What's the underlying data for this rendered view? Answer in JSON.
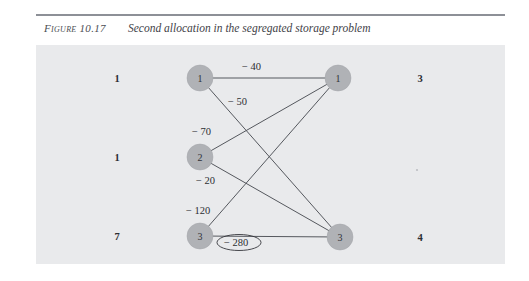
{
  "figure": {
    "label": "Figure 10.17",
    "caption": "Second allocation in the segregated storage problem"
  },
  "diagram": {
    "type": "bipartite-network",
    "left_nodes": [
      {
        "id": "L1",
        "label": "1",
        "supply": "1",
        "cx": 200,
        "cy": 78
      },
      {
        "id": "L2",
        "label": "2",
        "supply": "1",
        "cx": 200,
        "cy": 157
      },
      {
        "id": "L3",
        "label": "3",
        "supply": "7",
        "cx": 200,
        "cy": 236
      }
    ],
    "right_nodes": [
      {
        "id": "R1",
        "label": "1",
        "demand": "3",
        "cx": 338,
        "cy": 78
      },
      {
        "id": "R3",
        "label": "3",
        "demand": "4",
        "cx": 340,
        "cy": 237
      }
    ],
    "left_supply_x": 117,
    "right_demand_x": 420,
    "edges": [
      {
        "from": "L1",
        "to": "R1",
        "cost": "− 40",
        "label_x": 242,
        "label_y": 70,
        "circled": false
      },
      {
        "from": "L1",
        "to": "R3",
        "cost": "− 50",
        "label_x": 228,
        "label_y": 105,
        "circled": false
      },
      {
        "from": "L2",
        "to": "R1",
        "cost": "− 70",
        "label_x": 192,
        "label_y": 135,
        "circled": false
      },
      {
        "from": "L2",
        "to": "R3",
        "cost": "− 20",
        "label_x": 196,
        "label_y": 184,
        "circled": false
      },
      {
        "from": "L3",
        "to": "R1",
        "cost": "− 120",
        "label_x": 186,
        "label_y": 214,
        "circled": false
      },
      {
        "from": "L3",
        "to": "R3",
        "cost": "− 280",
        "label_x": 224,
        "label_y": 246,
        "circled": true
      }
    ],
    "node_radius": 13,
    "colors": {
      "panel_background": "#e9eaec",
      "node_fill": "#b0b2b6",
      "edge_stroke": "#55585e",
      "rule": "#8d9097",
      "text": "#2c2e33"
    }
  }
}
